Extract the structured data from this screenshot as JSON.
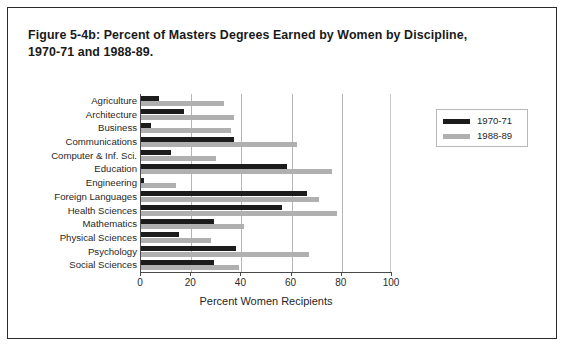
{
  "figure": {
    "title_line1": "Figure 5-4b: Percent of Masters Degrees Earned by Women  by Discipline,",
    "title_line2": "1970-71 and 1988-89."
  },
  "chart_data": {
    "type": "bar",
    "orientation": "horizontal",
    "title": "Figure 5-4b: Percent of Masters Degrees Earned by Women  by Discipline, 1970-71 and 1988-89.",
    "xlabel": "Percent Women Recipients",
    "ylabel": "",
    "xlim": [
      0,
      100
    ],
    "xticks": [
      0,
      20,
      40,
      60,
      80,
      100
    ],
    "xtick_labels": [
      "0",
      "20",
      "40",
      "60",
      "80",
      "100"
    ],
    "grid": true,
    "legend_position": "right",
    "categories": [
      "Agriculture",
      "Architecture",
      "Business",
      "Communications",
      "Computer & Inf. Sci.",
      "Education",
      "Engineering",
      "Foreign Languages",
      "Health Sciences",
      "Mathematics",
      "Physical Sciences",
      "Psychology",
      "Social Sciences"
    ],
    "series": [
      {
        "name": "1970-71",
        "color": "#1c1c1c",
        "values": [
          7,
          17,
          4,
          37,
          12,
          58,
          1,
          66,
          56,
          29,
          15,
          38,
          29
        ]
      },
      {
        "name": "1988-89",
        "color": "#b0b0b0",
        "values": [
          33,
          37,
          36,
          62,
          30,
          76,
          14,
          71,
          78,
          41,
          28,
          67,
          39
        ]
      }
    ]
  }
}
